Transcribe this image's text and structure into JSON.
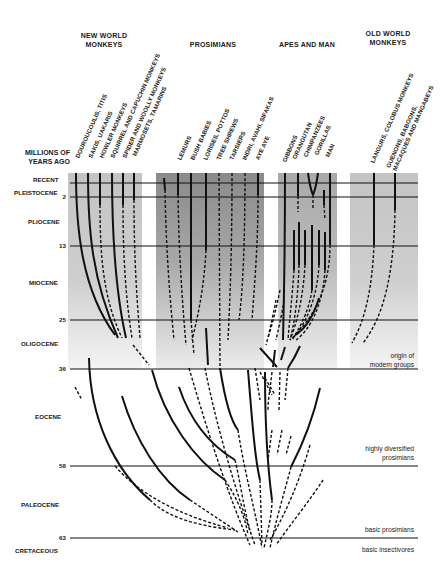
{
  "groups": {
    "new_world": {
      "title_line1": "NEW WORLD",
      "title_line2": "MONKEYS",
      "taxa": [
        "DOUROUCOULIS, TITIS",
        "SAKIS, UAKARIS",
        "HOWLER MONKEYS",
        "SQUIRREL AND CAPUCHIN MONKEYS",
        "SPIDER AND WOOLLY MONKEYS",
        "MARMOSETS, TAMARINS"
      ]
    },
    "prosimians": {
      "title": "PROSIMIANS",
      "taxa": [
        "LEMURS",
        "BUSH BABIES",
        "LORISES, POTTOS",
        "TREE SHREWS",
        "TARSIERS",
        "INDRI, AVAHI, SIFAKAS",
        "AYE AYE"
      ]
    },
    "apes": {
      "title": "APES AND MAN",
      "taxa": [
        "GIBBONS",
        "ORANGUTAN",
        "CHIMPANZEES",
        "GORILLAS",
        "MAN"
      ]
    },
    "old_world": {
      "title_line1": "OLD WORLD",
      "title_line2": "MONKEYS",
      "taxa": [
        "LANGURS, COLOBUS MONKEYS",
        "GUENONS, BABOONS, MACAQUES AND MANGABEYS"
      ]
    }
  },
  "axis": {
    "title_line1": "MILLIONS OF",
    "title_line2": "YEARS AGO",
    "epochs": [
      "RECENT",
      "PLEISTOCENE",
      "PLIOCENE",
      "MIOCENE",
      "OLIGOCENE",
      "EOCENE",
      "PALEOCENE",
      "CRETACEOUS"
    ],
    "ticks": [
      "2",
      "13",
      "25",
      "36",
      "58",
      "63"
    ]
  },
  "annotations": {
    "origin_line1": "origin of",
    "origin_line2": "modern groups",
    "diversified_line1": "highly diversified",
    "diversified_line2": "prosimians",
    "basic_prosimians": "basic prosimians",
    "basic_insectivores": "basic insectivores"
  },
  "colors": {
    "band_light": "#c9c9c9",
    "band_dark": "#8e8e8e",
    "line": "#111111"
  }
}
